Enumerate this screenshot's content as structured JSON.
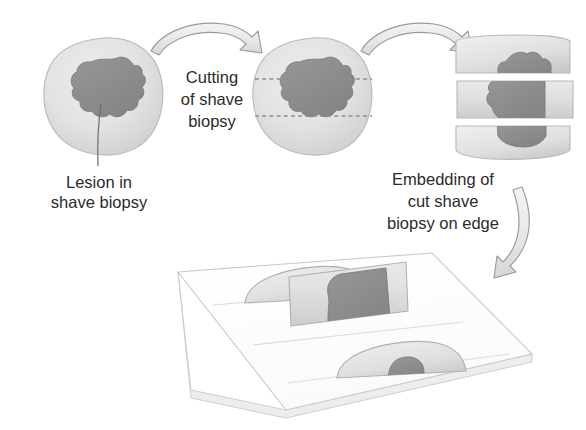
{
  "figure": {
    "background_color": "#ffffff"
  },
  "palette": {
    "tissue_light": "#e2e2e0",
    "tissue_mid": "#d2d2d0",
    "tissue_edge": "#b9b9b7",
    "lesion_dark": "#8b8b8b",
    "lesion_edge": "#7a7a7a",
    "arrow_fill": "#e9e9e9",
    "arrow_stroke": "#9a9a9a",
    "slide_fill": "#fdfdfd",
    "slide_stroke": "#c9c9c9",
    "dash_color": "#8f8f8f",
    "text_color": "#2b2b2b",
    "leader_color": "#6e6e6e"
  },
  "labels": {
    "lesion": {
      "lines": [
        "Lesion in",
        "shave biopsy"
      ],
      "line1": "Lesion in",
      "line2": "shave biopsy"
    },
    "cutting": {
      "lines": [
        "Cutting",
        "of shave",
        "biopsy"
      ],
      "line1": "Cutting",
      "line2": "of shave",
      "line3": "biopsy"
    },
    "embedding": {
      "lines": [
        "Embedding of",
        "cut shave",
        "biopsy on edge"
      ],
      "line1": "Embedding of",
      "line2": "cut shave",
      "line3": "biopsy on edge"
    }
  },
  "stages": {
    "stage1": {
      "name": "intact-shave-biopsy",
      "has_lesion": true
    },
    "stage2": {
      "name": "shave-biopsy-with-cut-lines",
      "cut_lines": 2
    },
    "stage3": {
      "name": "cut-shave-biopsy-three-pieces",
      "pieces": 3
    },
    "stage4": {
      "name": "glass-slide-with-embedded-sections",
      "sections": 3
    }
  },
  "arrows": {
    "arrow1": {
      "name": "arrow-stage1-to-stage2",
      "direction": "right"
    },
    "arrow2": {
      "name": "arrow-stage2-to-stage3",
      "direction": "right"
    },
    "arrow3": {
      "name": "arrow-stage3-to-slide",
      "direction": "down-left"
    }
  }
}
